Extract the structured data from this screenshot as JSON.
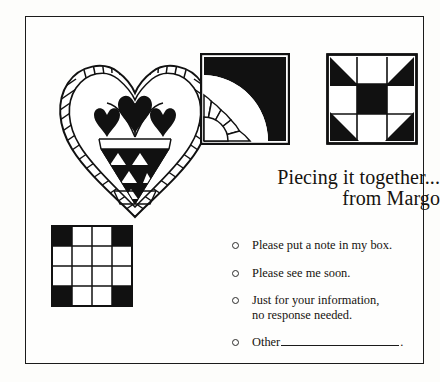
{
  "card": {
    "background_color": "#fdfdfb",
    "frame_color": "#1b1b1b",
    "ink_color": "#16130f"
  },
  "title": {
    "line1": "Piecing it together...",
    "line2": "from Margo"
  },
  "checklist": {
    "bullet_icon": "circle-outline-icon",
    "items": [
      {
        "label": "Please put a note in my box.",
        "line2": "",
        "has_fill_in_line": false,
        "trailing": ""
      },
      {
        "label": "Please see me soon.",
        "line2": "",
        "has_fill_in_line": false,
        "trailing": ""
      },
      {
        "label": "Just for your information,",
        "line2": "no response needed.",
        "has_fill_in_line": false,
        "trailing": ""
      },
      {
        "label": "Other",
        "line2": "",
        "has_fill_in_line": true,
        "trailing": "."
      }
    ]
  },
  "artwork": {
    "blocks": [
      {
        "name": "heart-basket-quilt-motif",
        "description": "Heart outline with braided rope border enclosing a triangular basket of three hearts",
        "fill_color": "#111111",
        "outline_color": "#111111"
      },
      {
        "name": "new-york-beauty-arc-quilt-block",
        "description": "Square block with thick black quarter arc and radiating white fan spokes",
        "fill_color": "#111111",
        "outline_color": "#111111"
      },
      {
        "name": "shoofly-quilt-block",
        "description": "Three by three block with black corner triangles and solid black center",
        "fill_color": "#111111",
        "outline_color": "#111111"
      },
      {
        "name": "four-patch-checkerboard-quilt-block",
        "description": "Four by four grid with black corner squares",
        "fill_color": "#111111",
        "outline_color": "#111111"
      }
    ]
  }
}
